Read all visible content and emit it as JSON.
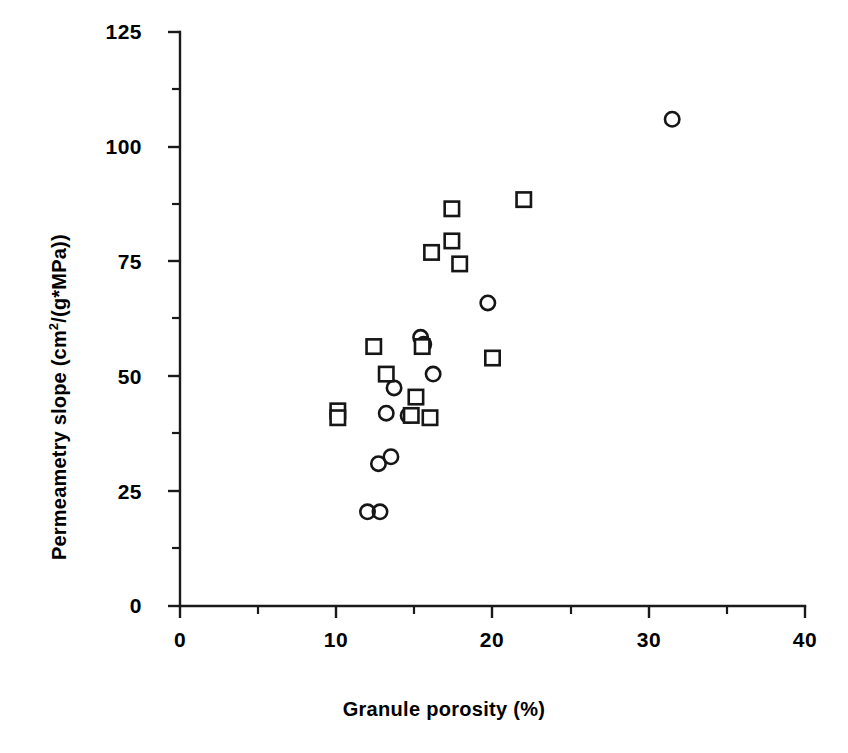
{
  "chart_data": {
    "type": "scatter",
    "title": "",
    "xlabel": "Granule porosity (%)",
    "ylabel": "Permeametry slope  (cm2/(g*MPa))",
    "ylabel_parts": {
      "prefix": "Permeametry  slope  (cm",
      "superscript": "2",
      "suffix": "/(g*MPa))"
    },
    "xlim": [
      0,
      40
    ],
    "ylim": [
      0,
      125
    ],
    "xticks": [
      0,
      10,
      20,
      30,
      40
    ],
    "xtick_labels": [
      "0",
      "10",
      "20",
      "30",
      "40"
    ],
    "xticks_minor": [
      5,
      15,
      25,
      35
    ],
    "yticks": [
      0,
      25,
      50,
      75,
      100,
      125
    ],
    "ytick_labels": [
      "0",
      "25",
      "50",
      "75",
      "100",
      "125"
    ],
    "yticks_minor": [
      12.5,
      37.5,
      62.5,
      87.5,
      112.5
    ],
    "grid": false,
    "legend": "none",
    "marker_color": "#161616",
    "background_color": "#ffffff",
    "series": [
      {
        "name": "circles",
        "marker": "circle",
        "points": [
          {
            "x": 31.5,
            "y": 106.0
          },
          {
            "x": 19.7,
            "y": 66.0
          },
          {
            "x": 15.4,
            "y": 58.5
          },
          {
            "x": 15.6,
            "y": 57.0
          },
          {
            "x": 16.2,
            "y": 50.5
          },
          {
            "x": 13.7,
            "y": 47.5
          },
          {
            "x": 13.2,
            "y": 42.0
          },
          {
            "x": 14.6,
            "y": 41.5
          },
          {
            "x": 12.7,
            "y": 31.0
          },
          {
            "x": 13.5,
            "y": 32.5
          },
          {
            "x": 12.0,
            "y": 20.5
          },
          {
            "x": 12.8,
            "y": 20.5
          }
        ]
      },
      {
        "name": "squares",
        "marker": "square",
        "points": [
          {
            "x": 22.0,
            "y": 88.5
          },
          {
            "x": 17.4,
            "y": 86.5
          },
          {
            "x": 17.4,
            "y": 79.5
          },
          {
            "x": 16.1,
            "y": 77.0
          },
          {
            "x": 17.9,
            "y": 74.5
          },
          {
            "x": 12.4,
            "y": 56.5
          },
          {
            "x": 15.5,
            "y": 56.5
          },
          {
            "x": 20.0,
            "y": 54.0
          },
          {
            "x": 13.2,
            "y": 50.5
          },
          {
            "x": 15.1,
            "y": 45.5
          },
          {
            "x": 10.1,
            "y": 42.5
          },
          {
            "x": 10.1,
            "y": 41.0
          },
          {
            "x": 14.8,
            "y": 41.5
          },
          {
            "x": 16.0,
            "y": 41.0
          }
        ]
      }
    ]
  },
  "axes": {
    "x_axis_name": "x-axis",
    "y_axis_name": "y-axis"
  }
}
